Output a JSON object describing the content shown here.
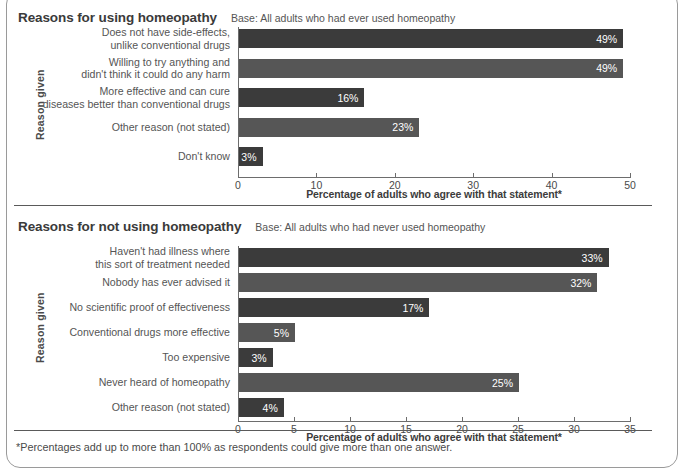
{
  "footnote": "*Percentages add up to more than 100% as respondents could give more than one answer.",
  "panels": [
    {
      "title": "Reasons for using homeopathy",
      "base": "Base: All adults who had ever used homeopathy",
      "y_axis_title": "Reason given",
      "x_axis_title": "Percentage of adults who agree with that statement*"
    },
    {
      "title": "Reasons for not using homeopathy",
      "base": "Base: All adults who had never used homeopathy",
      "y_axis_title": "Reason given",
      "x_axis_title": "Percentage of adults who agree with that statement*"
    }
  ],
  "chart_data": [
    {
      "type": "bar",
      "orientation": "horizontal",
      "title": "Reasons for using homeopathy",
      "subtitle": "Base: All adults who had ever used homeopathy",
      "xlabel": "Percentage of adults who agree with that statement*",
      "ylabel": "Reason given",
      "xlim": [
        0,
        50
      ],
      "xticks": [
        0,
        10,
        20,
        30,
        40,
        50
      ],
      "grid": false,
      "legend": "none",
      "categories": [
        "Does not have side-effects,\nunlike conventional drugs",
        "Willing to try anything and\ndidn't think it could do any harm",
        "More effective and can cure\ndiseases better than conventional drugs",
        "Other reason (not stated)",
        "Don't know"
      ],
      "values": [
        49,
        49,
        16,
        23,
        3
      ],
      "data_labels": [
        "49%",
        "49%",
        "16%",
        "23%",
        "3%"
      ],
      "bar_colors": [
        "#3b3b3b",
        "#565656",
        "#3b3b3b",
        "#565656",
        "#3b3b3b"
      ]
    },
    {
      "type": "bar",
      "orientation": "horizontal",
      "title": "Reasons for not using homeopathy",
      "subtitle": "Base: All adults who had never used homeopathy",
      "xlabel": "Percentage of adults who agree with that statement*",
      "ylabel": "Reason given",
      "xlim": [
        0,
        35
      ],
      "xticks": [
        0,
        5,
        10,
        15,
        20,
        25,
        30,
        35
      ],
      "grid": false,
      "legend": "none",
      "categories": [
        "Haven't had illness where\nthis sort of treatment needed",
        "Nobody has ever advised it",
        "No scientific proof of effectiveness",
        "Conventional drugs more effective",
        "Too expensive",
        "Never heard of homeopathy",
        "Other reason (not stated)"
      ],
      "values": [
        33,
        32,
        17,
        5,
        3,
        25,
        4
      ],
      "data_labels": [
        "33%",
        "32%",
        "17%",
        "5%",
        "3%",
        "25%",
        "4%"
      ],
      "bar_colors": [
        "#3b3b3b",
        "#565656",
        "#3b3b3b",
        "#565656",
        "#3b3b3b",
        "#565656",
        "#3b3b3b"
      ]
    }
  ]
}
